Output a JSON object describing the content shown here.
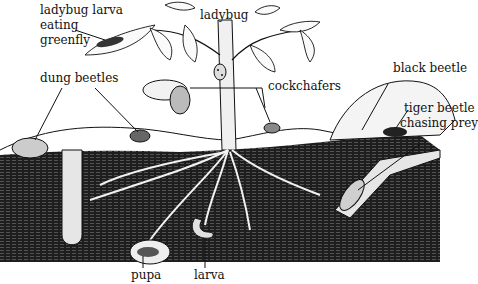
{
  "diagram": {
    "type": "illustration",
    "colors": {
      "background": "#ffffff",
      "ink": "#111111",
      "soil": "#1e1e1e",
      "soil_hatch": "#5a5a5a",
      "pale": "#f4f4f4"
    },
    "labels": {
      "ladybug_larva_line1": "ladybug larva",
      "ladybug_larva_line2": "eating",
      "ladybug_larva_line3": "greenfly",
      "ladybug": "ladybug",
      "dung_beetles": "dung beetles",
      "cockchafers": "cockchafers",
      "black_beetle": "black beetle",
      "tiger_beetle_line1": "tiger beetle",
      "tiger_beetle_line2": "chasing prey",
      "pupa": "pupa",
      "larva": "larva"
    }
  }
}
